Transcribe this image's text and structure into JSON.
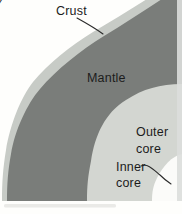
{
  "diagram": {
    "corner_text_fragment": "v",
    "labels": {
      "crust": "Crust",
      "mantle": "Mantle",
      "outer_core": [
        "Outer",
        "core"
      ],
      "inner_core": [
        "Inner",
        "core"
      ]
    },
    "colors": {
      "page": "#fefefc",
      "crust_band": "#c7cbc6",
      "mantle": "#7a7d7a",
      "outer_core": "#d3d6d1",
      "inner_core": "#fbfbf9",
      "page_edge_strip": "#dcdedb",
      "scan_smudge": "#d9d9d6",
      "text": "#1c1c1c",
      "leader_line": "#2a2a2a"
    }
  }
}
